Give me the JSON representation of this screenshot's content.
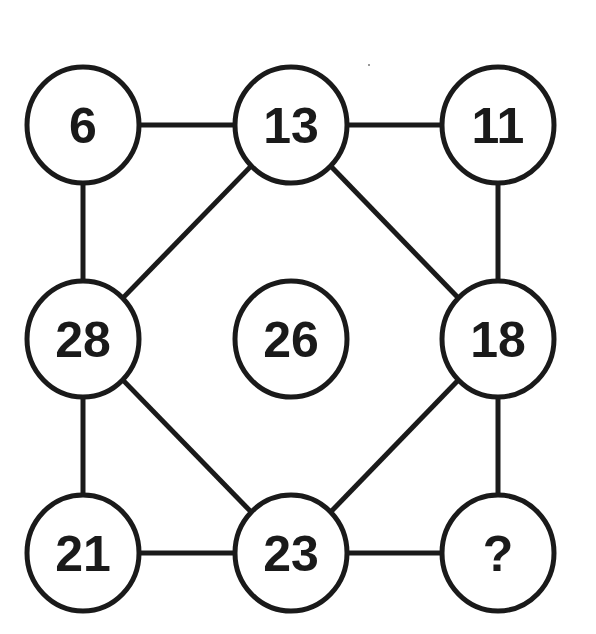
{
  "puzzle": {
    "type": "number-grid-missing-value",
    "colors": {
      "stroke": "#1a1a1a",
      "background": "#ffffff",
      "text": "#1a1a1a"
    },
    "nodes": [
      {
        "id": "top-left",
        "label": "6",
        "cx": 83,
        "cy": 125
      },
      {
        "id": "top-center",
        "label": "13",
        "cx": 291,
        "cy": 125
      },
      {
        "id": "top-right",
        "label": "11",
        "cx": 498,
        "cy": 125
      },
      {
        "id": "middle-left",
        "label": "28",
        "cx": 83,
        "cy": 339
      },
      {
        "id": "center",
        "label": "26",
        "cx": 291,
        "cy": 339
      },
      {
        "id": "middle-right",
        "label": "18",
        "cx": 498,
        "cy": 339
      },
      {
        "id": "bottom-left",
        "label": "21",
        "cx": 83,
        "cy": 553
      },
      {
        "id": "bottom-center",
        "label": "23",
        "cx": 291,
        "cy": 553
      },
      {
        "id": "bottom-right",
        "label": "?",
        "cx": 498,
        "cy": 553
      }
    ],
    "edges": [
      [
        "top-left",
        "top-center"
      ],
      [
        "top-center",
        "top-right"
      ],
      [
        "top-left",
        "middle-left"
      ],
      [
        "top-right",
        "middle-right"
      ],
      [
        "top-center",
        "middle-left"
      ],
      [
        "top-center",
        "middle-right"
      ],
      [
        "middle-left",
        "bottom-center"
      ],
      [
        "middle-right",
        "bottom-center"
      ],
      [
        "middle-left",
        "bottom-left"
      ],
      [
        "middle-right",
        "bottom-right"
      ],
      [
        "bottom-left",
        "bottom-center"
      ],
      [
        "bottom-center",
        "bottom-right"
      ]
    ]
  }
}
